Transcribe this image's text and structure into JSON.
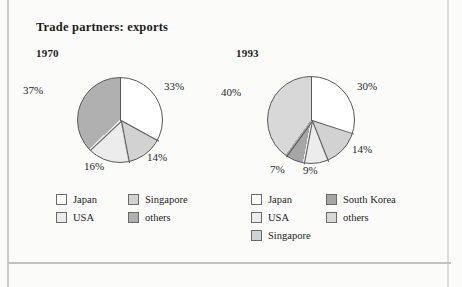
{
  "page": {
    "title": "Trade partners: exports",
    "background_color": "#fbfbfa"
  },
  "colors": {
    "japan": "#ffffff",
    "usa": "#ececec",
    "singapore": "#d2d2d2",
    "south_korea": "#a6a6a6",
    "others_1970": "#b0b0b0",
    "others_1993": "#d8d8d8",
    "outline": "#585858"
  },
  "chart_data": [
    {
      "type": "pie",
      "title": "1970",
      "categories": [
        "Japan",
        "Singapore",
        "USA",
        "others"
      ],
      "values": [
        33,
        14,
        16,
        37
      ],
      "labels": [
        "33%",
        "14%",
        "16%",
        "37%"
      ],
      "colors": [
        "#ffffff",
        "#d2d2d2",
        "#ececec",
        "#b0b0b0"
      ],
      "legend_position": "bottom",
      "legend": [
        {
          "label": "Japan",
          "color": "#ffffff"
        },
        {
          "label": "Singapore",
          "color": "#d2d2d2"
        },
        {
          "label": "USA",
          "color": "#ececec"
        },
        {
          "label": "others",
          "color": "#b0b0b0"
        }
      ]
    },
    {
      "type": "pie",
      "title": "1993",
      "categories": [
        "Japan",
        "Singapore",
        "USA",
        "South Korea",
        "others"
      ],
      "values": [
        30,
        14,
        9,
        7,
        40
      ],
      "labels": [
        "30%",
        "14%",
        "9%",
        "7%",
        "40%"
      ],
      "colors": [
        "#ffffff",
        "#d2d2d2",
        "#ececec",
        "#a6a6a6",
        "#d8d8d8"
      ],
      "legend_position": "bottom",
      "legend": [
        {
          "label": "Japan",
          "color": "#ffffff"
        },
        {
          "label": "South Korea",
          "color": "#a6a6a6"
        },
        {
          "label": "USA",
          "color": "#ececec"
        },
        {
          "label": "others",
          "color": "#d8d8d8"
        },
        {
          "label": "Singapore",
          "color": "#d2d2d2"
        }
      ]
    }
  ],
  "chart1": {
    "year": "1970",
    "pct_japan": "33%",
    "pct_singapore": "14%",
    "pct_usa": "16%",
    "pct_others": "37%",
    "legend": {
      "japan": "Japan",
      "singapore": "Singapore",
      "usa": "USA",
      "others": "others"
    }
  },
  "chart2": {
    "year": "1993",
    "pct_japan": "30%",
    "pct_singapore": "14%",
    "pct_usa": "9%",
    "pct_korea": "7%",
    "pct_others": "40%",
    "legend": {
      "japan": "Japan",
      "south_korea": "South Korea",
      "usa": "USA",
      "others": "others",
      "singapore": "Singapore"
    }
  }
}
